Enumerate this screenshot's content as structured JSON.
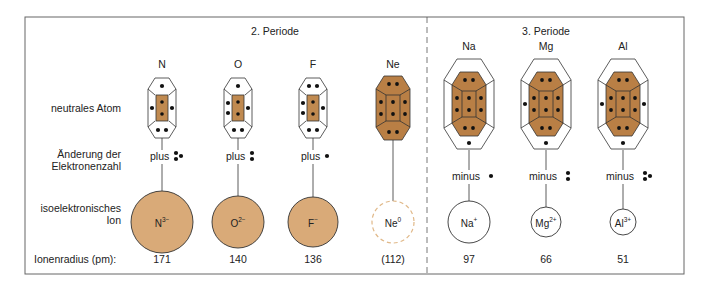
{
  "periods": [
    {
      "label": "2. Periode"
    },
    {
      "label": "3. Periode"
    }
  ],
  "row_labels": {
    "atom": "neutrales Atom",
    "change_line1": "Änderung der",
    "change_line2": "Elektronenzahl",
    "ion_line1": "isoelektronisches",
    "ion_line2": "Ion",
    "radius": "Ionenradius (pm):"
  },
  "elements": [
    {
      "symbol": "N",
      "period": 2,
      "change_word": "plus",
      "change_count": 3,
      "ion_base": "N",
      "ion_charge": "3−",
      "radius": "171",
      "valence": 5
    },
    {
      "symbol": "O",
      "period": 2,
      "change_word": "plus",
      "change_count": 2,
      "ion_base": "O",
      "ion_charge": "2−",
      "radius": "140",
      "valence": 6
    },
    {
      "symbol": "F",
      "period": 2,
      "change_word": "plus",
      "change_count": 1,
      "ion_base": "F",
      "ion_charge": "−",
      "radius": "136",
      "valence": 7
    },
    {
      "symbol": "Ne",
      "period": 2,
      "change_word": "",
      "change_count": 0,
      "ion_base": "Ne",
      "ion_charge": "0",
      "radius": "(112)",
      "valence": 8
    },
    {
      "symbol": "Na",
      "period": 3,
      "change_word": "minus",
      "change_count": 1,
      "ion_base": "Na",
      "ion_charge": "+",
      "radius": "97",
      "valence": 1
    },
    {
      "symbol": "Mg",
      "period": 3,
      "change_word": "minus",
      "change_count": 2,
      "ion_base": "Mg",
      "ion_charge": "2+",
      "radius": "66",
      "valence": 2
    },
    {
      "symbol": "Al",
      "period": 3,
      "change_word": "minus",
      "change_count": 3,
      "ion_base": "Al",
      "ion_charge": "3+",
      "radius": "51",
      "valence": 3
    }
  ],
  "colors": {
    "fill": "#d9aa78",
    "fill_dark": "#b97f45",
    "core": "#c08a50",
    "stroke": "#333333",
    "frame": "#666666",
    "dot": "#111111",
    "ne_dashed": "#e0b888"
  }
}
